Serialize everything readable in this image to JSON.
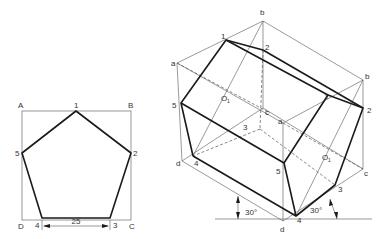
{
  "left_view": {
    "corner_labels": {
      "A": "A",
      "B": "B",
      "C": "C",
      "D": "D"
    },
    "vertex_labels": {
      "v1": "1",
      "v2": "2",
      "v3": "3",
      "v4": "4",
      "v5": "5"
    },
    "dimension": "25"
  },
  "iso_view": {
    "box_labels": {
      "b_top": "b",
      "b_right": "b",
      "a_left": "a",
      "a_mid": "a",
      "c_back": "c",
      "c_right": "c",
      "d_left": "d",
      "d_bottom": "d"
    },
    "front_labels": {
      "v1": "1",
      "v2": "2",
      "v3": "3",
      "v4": "4",
      "v5": "5"
    },
    "back_labels": {
      "v1": "1",
      "v2": "2",
      "v3": "3",
      "v4": "4",
      "v5": "5"
    },
    "center_labels": {
      "front": "O",
      "back": "O",
      "sub": "1"
    },
    "angle_left": "30°",
    "angle_right": "30°"
  }
}
